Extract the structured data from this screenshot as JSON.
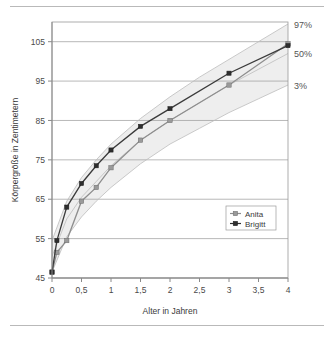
{
  "chart_data": {
    "type": "line",
    "title": "",
    "xlabel": "Alter in Jahren",
    "ylabel": "Körpergröße in Zentimetern",
    "xlim": [
      0,
      4
    ],
    "ylim": [
      45,
      110
    ],
    "grid": true,
    "y_ticks": [
      45,
      55,
      65,
      75,
      85,
      95,
      105
    ],
    "x_ticks": [
      "0",
      "0,5",
      "1",
      "1,5",
      "2",
      "2,5",
      "3",
      "3,5",
      "4"
    ],
    "x_tick_values": [
      0,
      0.5,
      1,
      1.5,
      2,
      2.5,
      3,
      3.5,
      4
    ],
    "legend_position": "inside-right-lower",
    "series": [
      {
        "name": "Anita",
        "color": "#9a9a9a",
        "marker": "square",
        "x": [
          0,
          0.083,
          0.25,
          0.5,
          0.75,
          1,
          1.5,
          2,
          3,
          4
        ],
        "values": [
          46.5,
          51.5,
          54.5,
          64.5,
          68,
          73,
          80,
          85,
          94,
          104.5
        ]
      },
      {
        "name": "Brigitt",
        "color": "#2e2e2e",
        "marker": "diamond",
        "x": [
          0,
          0.083,
          0.25,
          0.5,
          0.75,
          1,
          1.5,
          2,
          3,
          4
        ],
        "values": [
          46.5,
          54.5,
          63,
          69,
          73.5,
          77.5,
          83.5,
          88,
          97,
          104
        ]
      }
    ],
    "percentile_bands": [
      {
        "name": "97%",
        "label": "97%",
        "x": [
          0,
          0.25,
          0.5,
          0.75,
          1,
          1.5,
          2,
          2.5,
          3,
          3.5,
          4
        ],
        "values": [
          54.5,
          64.5,
          70.5,
          75,
          79,
          85.5,
          91,
          96,
          100.5,
          105,
          109.5
        ]
      },
      {
        "name": "50%",
        "label": "50%",
        "x": [
          0,
          0.25,
          0.5,
          0.75,
          1,
          1.5,
          2,
          2.5,
          3,
          3.5,
          4
        ],
        "values": [
          50.5,
          60,
          65.5,
          69.5,
          73.5,
          80,
          85,
          89.5,
          94,
          98,
          102
        ]
      },
      {
        "name": "3%",
        "label": "3%",
        "x": [
          0,
          0.25,
          0.5,
          0.75,
          1,
          1.5,
          2,
          2.5,
          3,
          3.5,
          4
        ],
        "values": [
          46.5,
          55.5,
          60.5,
          64.5,
          68,
          74,
          79,
          83,
          87,
          90.5,
          94
        ]
      }
    ]
  },
  "axes": {
    "y_title": "Körpergröße in Zentimetern",
    "x_title": "Alter in Jahren",
    "y_tick_labels": [
      "105",
      "95",
      "85",
      "75",
      "65",
      "55",
      "45"
    ],
    "x_tick_labels": [
      "0",
      "0,5",
      "1",
      "1,5",
      "2",
      "2,5",
      "3",
      "3,5",
      "4"
    ]
  },
  "percentile_labels": {
    "top": "97%",
    "middle": "50%",
    "bottom": "3%"
  },
  "legend": {
    "items": [
      {
        "label": "Anita"
      },
      {
        "label": "Brigitt"
      }
    ]
  }
}
